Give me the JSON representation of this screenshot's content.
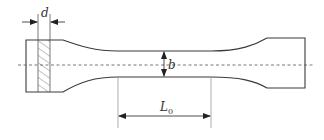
{
  "diagram": {
    "labels": {
      "thickness": "d",
      "width": "b",
      "gauge_length_main": "L",
      "gauge_length_sub": "0"
    },
    "colors": {
      "outline": "#3a3a3a",
      "hatch": "#6a6a6a",
      "centerline": "#555555",
      "extension": "#8a8a8a"
    }
  }
}
